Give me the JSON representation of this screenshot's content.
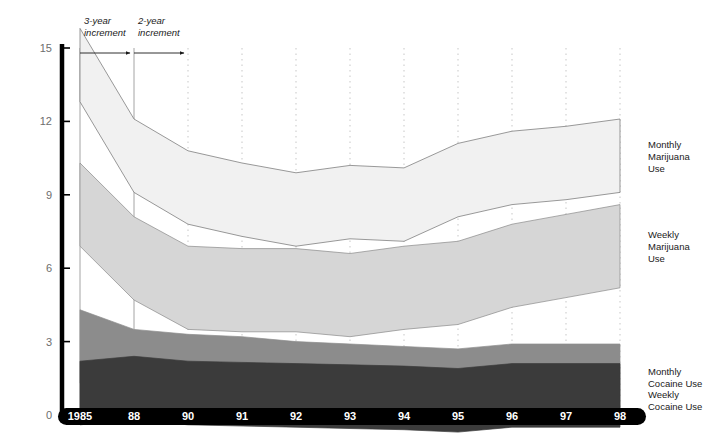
{
  "chart_data": {
    "type": "area",
    "title": "",
    "subtitle": "",
    "xlabel": "",
    "ylabel": "",
    "grid": true,
    "legend_position": "right-inline",
    "categories": [
      "1985",
      "88",
      "90",
      "91",
      "92",
      "93",
      "94",
      "95",
      "96",
      "97",
      "98"
    ],
    "x_tick_labels": [
      "1985",
      "88",
      "90",
      "91",
      "92",
      "93",
      "94",
      "95",
      "96",
      "97",
      "98"
    ],
    "y_tick_labels": [
      "0",
      "3",
      "6",
      "9",
      "12",
      "15"
    ],
    "y_ticks": [
      0,
      3,
      6,
      9,
      12,
      15
    ],
    "ylim": [
      0,
      15
    ],
    "series": [
      {
        "name": "Monthly Marijuana Use",
        "label_lines": [
          "Monthly",
          "Marijuana",
          "Use"
        ],
        "color": "#f1f1f1",
        "stroke": "#6e6e6e",
        "band_width": 3.0,
        "values": [
          14.3,
          10.6,
          9.3,
          8.8,
          8.4,
          8.7,
          8.6,
          9.6,
          10.1,
          10.3,
          10.6
        ]
      },
      {
        "name": "Weekly Marijuana Use",
        "label_lines": [
          "Weekly",
          "Marijuana",
          "Use"
        ],
        "color": "#d6d6d6",
        "stroke": "#8a8a8a",
        "band_width": 3.4,
        "values": [
          8.6,
          6.4,
          5.2,
          5.1,
          5.1,
          4.9,
          5.2,
          5.4,
          6.1,
          6.5,
          6.9
        ]
      },
      {
        "name": "Monthly Cocaine Use",
        "label_lines": [
          "Monthly",
          "Cocaine Use"
        ],
        "color": "#8c8c8c",
        "stroke": "#8c8c8c",
        "band_width": 3.0,
        "values": [
          2.8,
          2.0,
          1.8,
          1.7,
          1.5,
          1.4,
          1.3,
          1.2,
          1.4,
          1.4,
          1.4
        ]
      },
      {
        "name": "Weekly Cocaine Use",
        "label_lines": [
          "Weekly",
          "Cocaine Use"
        ],
        "color": "#3b3b3b",
        "stroke": "#3b3b3b",
        "band_width": 2.6,
        "values": [
          0.9,
          1.1,
          0.9,
          0.85,
          0.8,
          0.75,
          0.7,
          0.6,
          0.8,
          0.8,
          0.8
        ]
      }
    ],
    "annotations": [
      {
        "id": "three-year",
        "text_lines": [
          "3-year",
          "increment"
        ],
        "from_category": "1985",
        "to_category": "88"
      },
      {
        "id": "two-year",
        "text_lines": [
          "2-year",
          "increment"
        ],
        "from_category": "88",
        "to_category": "90"
      }
    ],
    "gridline_style": {
      "solid_categories": [
        "1985",
        "88"
      ],
      "dotted_categories": [
        "90",
        "91",
        "92",
        "93",
        "94",
        "95",
        "96",
        "97",
        "98"
      ],
      "color": "#b9b9b9"
    },
    "axis_color": "#000000",
    "axis_label_color": "#6d6d6d"
  }
}
